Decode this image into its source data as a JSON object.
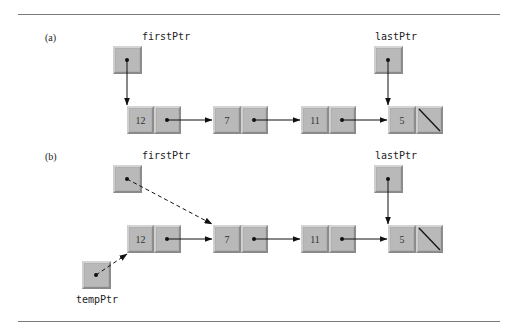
{
  "figure": {
    "panel_a": {
      "label": "(a)",
      "first_ptr_label": "firstPtr",
      "last_ptr_label": "lastPtr",
      "nodes": [
        "12",
        "7",
        "11",
        "5"
      ]
    },
    "panel_b": {
      "label": "(b)",
      "first_ptr_label": "firstPtr",
      "last_ptr_label": "lastPtr",
      "temp_ptr_label": "tempPtr",
      "nodes": [
        "12",
        "7",
        "11",
        "5"
      ]
    }
  },
  "colors": {
    "node_fill": "#b9b9b9",
    "rule": "#7a7a7a",
    "arrow": "#111111"
  }
}
